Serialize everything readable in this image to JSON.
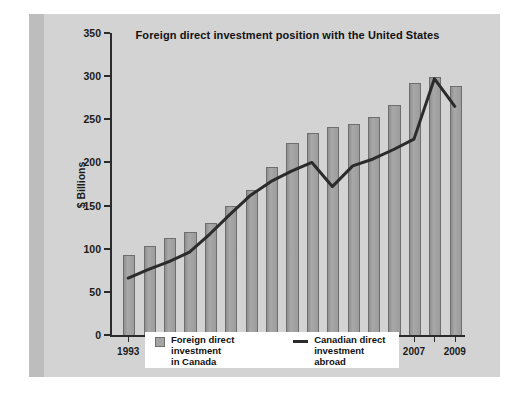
{
  "figure": {
    "background_color": "#d3d3d3",
    "bar_color": "#9c9c9c",
    "line_color": "#2b2b2b"
  },
  "legend": {
    "bars_label": "Foreign direct investment\nin Canada",
    "line_label": "Canadian direct\ninvestment abroad",
    "bars_icon": "square-swatch-icon",
    "line_icon": "line-swatch-icon"
  },
  "chart_data": {
    "type": "bar",
    "title": "Foreign direct investment position with the United States",
    "xlabel": "",
    "ylabel": "$ Billions",
    "ylim": [
      0,
      350
    ],
    "yticks": [
      0,
      50,
      100,
      150,
      200,
      250,
      300,
      350
    ],
    "grid": false,
    "legend_position": "bottom",
    "categories": [
      "1993",
      "1994",
      "1995",
      "1996",
      "1997",
      "1998",
      "1999",
      "2000",
      "2001",
      "2002",
      "2003",
      "2004",
      "2005",
      "2006",
      "2007",
      "2008",
      "2009"
    ],
    "xtick_labels": [
      "1993",
      "1995",
      "1997",
      "1999",
      "2001",
      "2003",
      "2005",
      "2007",
      "2009"
    ],
    "series": [
      {
        "name": "Foreign direct investment in Canada",
        "type": "bar",
        "values": [
          91,
          102,
          111,
          118,
          129,
          148,
          167,
          193,
          221,
          233,
          240,
          243,
          252,
          265,
          291,
          298,
          288
        ]
      },
      {
        "name": "Canadian direct investment abroad",
        "type": "line",
        "values": [
          66,
          76,
          85,
          96,
          117,
          140,
          162,
          178,
          190,
          200,
          172,
          196,
          204,
          215,
          227,
          297,
          265
        ]
      }
    ]
  }
}
